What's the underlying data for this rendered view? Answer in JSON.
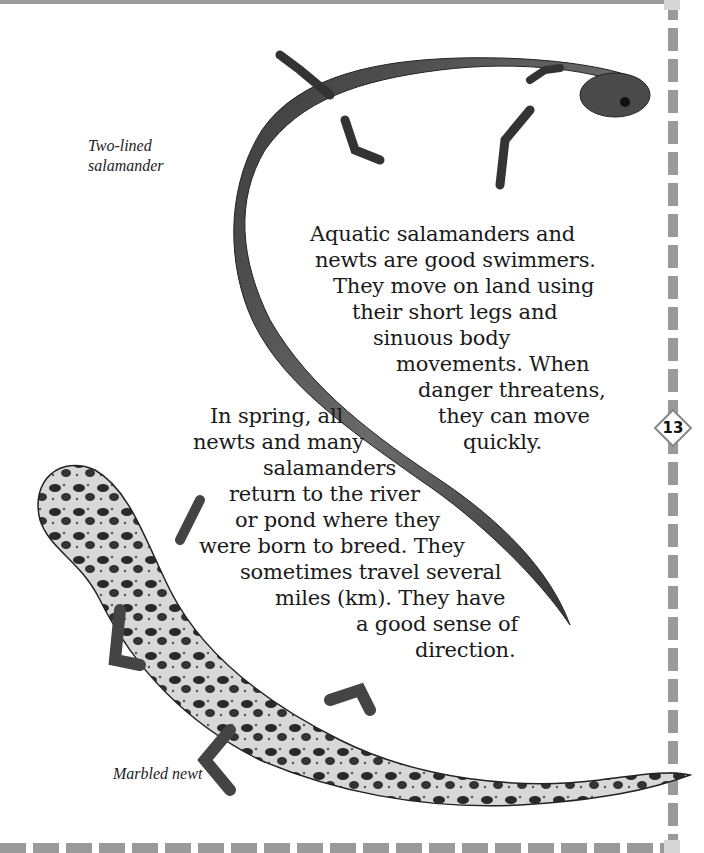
{
  "page": {
    "number": "13",
    "captions": {
      "two_lined": [
        "Two-lined",
        "salamander"
      ],
      "marbled": "Marbled newt"
    },
    "paragraph_1": [
      {
        "text": "Aquatic salamanders and",
        "x": 310,
        "y": 222
      },
      {
        "text": "newts are good swimmers.",
        "x": 315,
        "y": 248
      },
      {
        "text": "They move on land using",
        "x": 333,
        "y": 274
      },
      {
        "text": "their short legs and",
        "x": 352,
        "y": 300
      },
      {
        "text": "sinuous body",
        "x": 373,
        "y": 326
      },
      {
        "text": "movements.  When",
        "x": 396,
        "y": 352
      },
      {
        "text": "danger threatens,",
        "x": 418,
        "y": 378
      },
      {
        "text": "they can move",
        "x": 438,
        "y": 404
      },
      {
        "text": "quickly.",
        "x": 463,
        "y": 430
      }
    ],
    "paragraph_2": [
      {
        "text": "In spring, all",
        "x": 210,
        "y": 404
      },
      {
        "text": "newts and many",
        "x": 193,
        "y": 430
      },
      {
        "text": "salamanders",
        "x": 263,
        "y": 456
      },
      {
        "text": "return to the river",
        "x": 229,
        "y": 482
      },
      {
        "text": "or pond where they",
        "x": 235,
        "y": 508
      },
      {
        "text": "were born to breed.  They",
        "x": 199,
        "y": 534
      },
      {
        "text": "sometimes travel several",
        "x": 240,
        "y": 560
      },
      {
        "text": "miles (km).  They have",
        "x": 275,
        "y": 586
      },
      {
        "text": "a good sense of",
        "x": 356,
        "y": 612
      },
      {
        "text": "direction.",
        "x": 415,
        "y": 638
      }
    ]
  }
}
